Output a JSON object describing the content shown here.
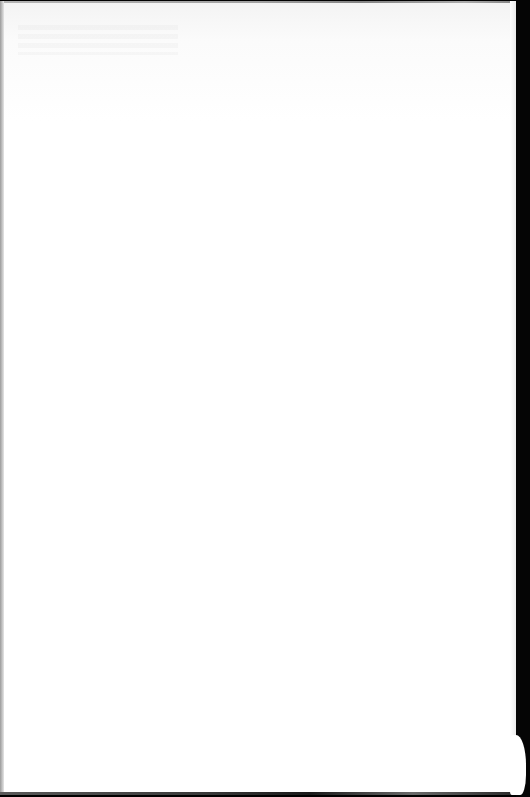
{
  "document": {
    "type": "scanned-page",
    "content_text": "",
    "state": "blank"
  },
  "colors": {
    "paper": "#ffffff",
    "scanner_bed": "#000000",
    "edge_shadow": "#8a8a8a"
  }
}
